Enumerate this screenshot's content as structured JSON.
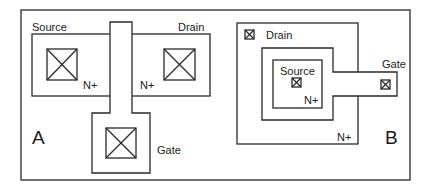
{
  "figure": {
    "colors": {
      "stroke": "#2a2a2a",
      "frame": "#3a3a3a",
      "background": "#ffffff"
    }
  },
  "layout_a": {
    "panel_label": "A",
    "source_label": "Source",
    "drain_label": "Drain",
    "gate_label": "Gate",
    "n_plus_left": "N+",
    "n_plus_right": "N+",
    "contact_icon": "crossed-box-contact"
  },
  "layout_b": {
    "panel_label": "B",
    "drain_label": "Drain",
    "source_label": "Source",
    "gate_label": "Gate",
    "n_plus_inner": "N+",
    "n_plus_outer": "N+",
    "contact_icon": "crossed-box-contact"
  }
}
